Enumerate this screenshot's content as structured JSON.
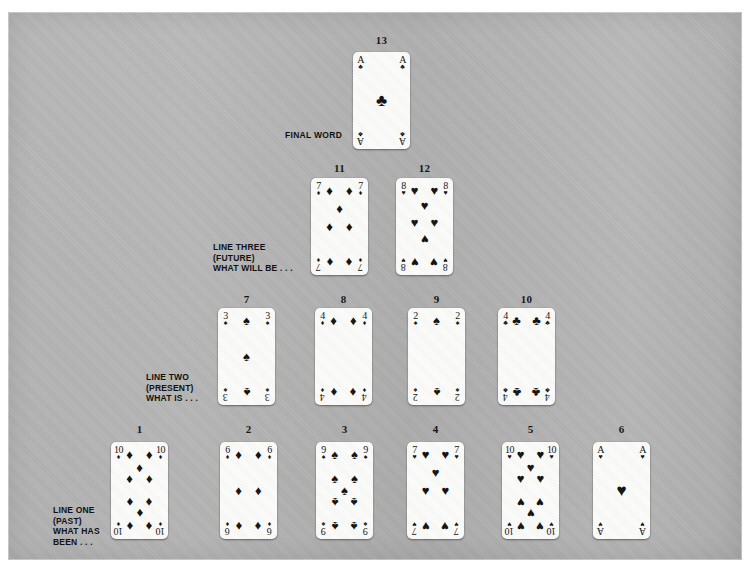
{
  "layout": {
    "title": "Tarot-style playing card spread",
    "background_color": "#b5b5b5",
    "page_background": "#ffffff"
  },
  "labels": {
    "final_word": "FINAL WORD",
    "line_three": "LINE THREE\n(FUTURE)\nWHAT WILL BE . . .",
    "line_two": "LINE TWO\n(PRESENT)\nWHAT IS . . .",
    "line_one": "LINE ONE\n(PAST)\nWHAT HAS\nBEEN . . ."
  },
  "suits": {
    "spade": "♠",
    "heart": "♥",
    "diamond": "♦",
    "club": "♣"
  },
  "cards": [
    {
      "number": "1",
      "rank": "10",
      "suit": "diamond",
      "suit_glyph": "♦",
      "x": 103,
      "y": 430,
      "label_y": 411
    },
    {
      "number": "2",
      "rank": "6",
      "suit": "diamond",
      "suit_glyph": "♦",
      "x": 212,
      "y": 430,
      "label_y": 411
    },
    {
      "number": "3",
      "rank": "9",
      "suit": "spade",
      "suit_glyph": "♠",
      "x": 308,
      "y": 430,
      "label_y": 411
    },
    {
      "number": "4",
      "rank": "7",
      "suit": "heart",
      "suit_glyph": "♥",
      "x": 399,
      "y": 430,
      "label_y": 411
    },
    {
      "number": "5",
      "rank": "10",
      "suit": "heart",
      "suit_glyph": "♥",
      "x": 494,
      "y": 430,
      "label_y": 411
    },
    {
      "number": "6",
      "rank": "A",
      "suit": "heart",
      "suit_glyph": "♥",
      "x": 585,
      "y": 430,
      "label_y": 411
    },
    {
      "number": "7",
      "rank": "3",
      "suit": "spade",
      "suit_glyph": "♠",
      "x": 210,
      "y": 296,
      "label_y": 281
    },
    {
      "number": "8",
      "rank": "4",
      "suit": "diamond",
      "suit_glyph": "♦",
      "x": 307,
      "y": 296,
      "label_y": 281
    },
    {
      "number": "9",
      "rank": "2",
      "suit": "spade",
      "suit_glyph": "♠",
      "x": 400,
      "y": 296,
      "label_y": 281
    },
    {
      "number": "10",
      "rank": "4",
      "suit": "club",
      "suit_glyph": "♣",
      "x": 490,
      "y": 296,
      "label_y": 281
    },
    {
      "number": "11",
      "rank": "7",
      "suit": "diamond",
      "suit_glyph": "♦",
      "x": 303,
      "y": 166,
      "label_y": 150
    },
    {
      "number": "12",
      "rank": "8",
      "suit": "heart",
      "suit_glyph": "♥",
      "x": 388,
      "y": 166,
      "label_y": 150
    },
    {
      "number": "13",
      "rank": "A",
      "suit": "club",
      "suit_glyph": "♣",
      "x": 345,
      "y": 40,
      "label_y": 22
    }
  ],
  "label_positions": {
    "final_word": {
      "x": 277,
      "y": 118
    },
    "line_three": {
      "x": 205,
      "y": 230
    },
    "line_two": {
      "x": 138,
      "y": 360
    },
    "line_one": {
      "x": 45,
      "y": 493
    }
  },
  "pip_layouts": {
    "A": [
      [
        50,
        50
      ]
    ],
    "2": [
      [
        50,
        10
      ],
      [
        50,
        90
      ]
    ],
    "3": [
      [
        50,
        10
      ],
      [
        50,
        50
      ],
      [
        50,
        90
      ]
    ],
    "4": [
      [
        18,
        10
      ],
      [
        82,
        10
      ],
      [
        18,
        90
      ],
      [
        82,
        90
      ]
    ],
    "6": [
      [
        18,
        10
      ],
      [
        82,
        10
      ],
      [
        18,
        50
      ],
      [
        82,
        50
      ],
      [
        18,
        90
      ],
      [
        82,
        90
      ]
    ],
    "7": [
      [
        18,
        10
      ],
      [
        82,
        10
      ],
      [
        50,
        30
      ],
      [
        18,
        50
      ],
      [
        82,
        50
      ],
      [
        18,
        90
      ],
      [
        82,
        90
      ]
    ],
    "8": [
      [
        18,
        10
      ],
      [
        82,
        10
      ],
      [
        50,
        26
      ],
      [
        18,
        46
      ],
      [
        82,
        46
      ],
      [
        50,
        65
      ],
      [
        18,
        90
      ],
      [
        82,
        90
      ]
    ],
    "9": [
      [
        18,
        10
      ],
      [
        82,
        10
      ],
      [
        18,
        36
      ],
      [
        82,
        36
      ],
      [
        50,
        50
      ],
      [
        18,
        64
      ],
      [
        82,
        64
      ],
      [
        18,
        90
      ],
      [
        82,
        90
      ]
    ],
    "10": [
      [
        18,
        10
      ],
      [
        82,
        10
      ],
      [
        50,
        24
      ],
      [
        18,
        37
      ],
      [
        82,
        37
      ],
      [
        18,
        63
      ],
      [
        82,
        63
      ],
      [
        50,
        76
      ],
      [
        18,
        90
      ],
      [
        82,
        90
      ]
    ]
  },
  "pip_inverted_index": {
    "6": [
      4,
      5
    ],
    "7": [
      5,
      6
    ],
    "8": [
      5,
      6,
      7
    ],
    "9": [
      5,
      6,
      7,
      8
    ],
    "10": [
      5,
      6,
      7,
      8,
      9
    ],
    "4": [
      2,
      3
    ],
    "3": [
      2
    ],
    "2": [
      1
    ]
  }
}
